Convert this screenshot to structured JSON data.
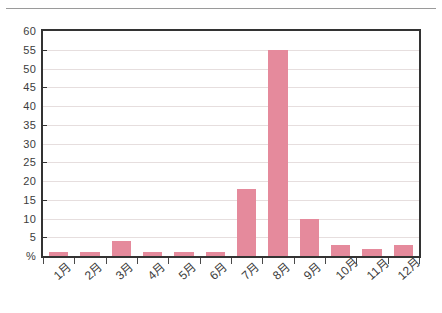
{
  "chart_data": {
    "type": "bar",
    "title": "",
    "xlabel": "",
    "ylabel": "%",
    "ylim": [
      0,
      60
    ],
    "ytick_step": 5,
    "grid": true,
    "legend": null,
    "bar_color": "#e58a9c",
    "categories": [
      "1月",
      "2月",
      "3月",
      "4月",
      "5月",
      "6月",
      "7月",
      "8月",
      "9月",
      "10月",
      "11月",
      "12月"
    ],
    "values": [
      1,
      1,
      4,
      1,
      1,
      1,
      18,
      55,
      10,
      3,
      2,
      3
    ],
    "ytick_labels": [
      "60",
      "55",
      "50",
      "45",
      "40",
      "35",
      "30",
      "25",
      "20",
      "15",
      "10",
      "5",
      "%"
    ],
    "ytick_values": [
      60,
      55,
      50,
      45,
      40,
      35,
      30,
      25,
      20,
      15,
      10,
      5,
      0
    ]
  },
  "axis": {
    "unit_label": "%"
  }
}
